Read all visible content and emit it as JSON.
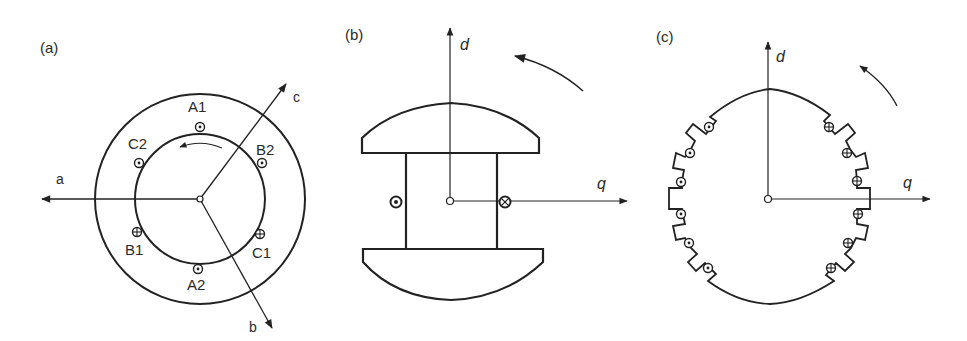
{
  "figure": {
    "panels": [
      {
        "id": "a",
        "label": "(a)",
        "description": "Three-phase stator with windings and magnetic axes",
        "axes": {
          "a": "a",
          "b": "b",
          "c": "c"
        },
        "conductors": [
          {
            "name": "A1",
            "symbol": "dot"
          },
          {
            "name": "C2",
            "symbol": "dot"
          },
          {
            "name": "B2",
            "symbol": "dot"
          },
          {
            "name": "B1",
            "symbol": "cross"
          },
          {
            "name": "C1",
            "symbol": "cross"
          },
          {
            "name": "A2",
            "symbol": "dot"
          }
        ]
      },
      {
        "id": "b",
        "label": "(b)",
        "description": "Salient-pole rotor with field winding",
        "axes": {
          "d": "d",
          "q": "q"
        },
        "conductors": [
          {
            "name": "left",
            "symbol": "dot"
          },
          {
            "name": "right",
            "symbol": "cross"
          }
        ]
      },
      {
        "id": "c",
        "label": "(c)",
        "description": "Cylindrical (round) rotor with distributed slots",
        "axes": {
          "d": "d",
          "q": "q"
        },
        "slots_left": 6,
        "slots_right": 6,
        "left_symbol": "dot",
        "right_symbol": "cross"
      }
    ]
  }
}
